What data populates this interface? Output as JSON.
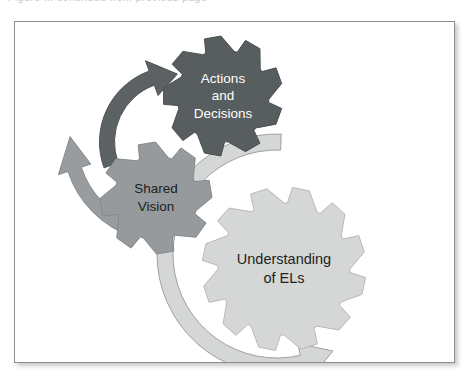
{
  "page": {
    "top_sliver_text": "Figure ... continued from previous page",
    "background_color": "#ffffff"
  },
  "figure": {
    "name": "gears-cycle-diagram",
    "panel": {
      "border_color": "#8b8d8f",
      "background_color": "#ffffff"
    },
    "gears": [
      {
        "id": "actions-and-decisions",
        "label_lines": [
          "Actions",
          "and",
          "Decisions"
        ],
        "fill": "#585d5f",
        "stroke": "#4a4f51",
        "text_color": "#ffffff",
        "cx": 208,
        "cy": 74,
        "outer_r": 60,
        "inner_r": 46,
        "teeth": 9,
        "rotation": 8
      },
      {
        "id": "shared-vision",
        "label_lines": [
          "Shared",
          "Vision"
        ],
        "fill": "#969a9c",
        "stroke": "#85898b",
        "text_color": "#1d1f21",
        "cx": 141,
        "cy": 176,
        "outer_r": 56,
        "inner_r": 42,
        "teeth": 8,
        "rotation": 22
      },
      {
        "id": "understanding-of-els",
        "label_lines": [
          "Understanding",
          "of ELs"
        ],
        "fill": "#d5d7d6",
        "stroke": "#b7b9b8",
        "text_color": "#1d1f21",
        "cx": 269,
        "cy": 247,
        "outer_r": 82,
        "inner_r": 66,
        "teeth": 12,
        "rotation": 3
      }
    ],
    "arrows": [
      {
        "id": "arrow-to-actions",
        "direction": "up-right",
        "fill": "#5c6163",
        "stroke": "#4e5254"
      },
      {
        "id": "arrow-to-shared-vision",
        "direction": "down-left",
        "fill": "#989c9e",
        "stroke": "#85898b"
      },
      {
        "id": "arrow-to-understanding",
        "direction": "down-right-sweep",
        "fill": "#d5d7d6",
        "stroke": "#9fa1a0"
      }
    ]
  }
}
